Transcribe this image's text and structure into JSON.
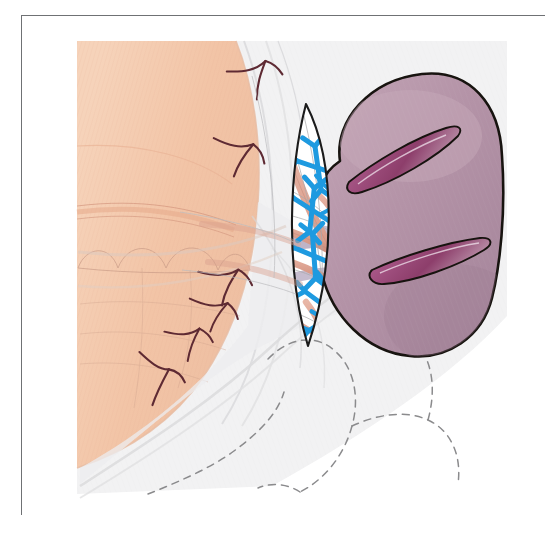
{
  "figure": {
    "caption": "",
    "frame": {
      "border_color": "#6f7174",
      "background": "#ffffff"
    }
  },
  "palette": {
    "skin_tissue": "#f3c7ab",
    "skin_tissue_light": "#f7d7c2",
    "kidney_body": "#b191a5",
    "kidney_body_light": "#c0a2b3",
    "kidney_outline": "#17130f",
    "incision_dark": "#8e4a72",
    "incision_deep": "#7a3a60",
    "vessel_pink": "#dda392",
    "vessel_pink_dark": "#c9897a",
    "nerve_blue": "#1e9ae0",
    "nerve_dark_red": "#5e2a33",
    "fascia_gray": "#e9e9ea",
    "fascia_gray_mid": "#dcdcdd",
    "dashed_outline": "#8b8b8d",
    "lens_fill": "#ffffff",
    "lens_outline": "#1b1b1b",
    "background_tint": "#f4f4f4"
  },
  "structures": [
    {
      "id": "abdominal-wall",
      "label": "Abdominal wall / peritoneal flap",
      "color": "#f3c7ab"
    },
    {
      "id": "kidney",
      "label": "Kidney",
      "color": "#b191a5"
    },
    {
      "id": "kidney-incision-upper",
      "label": "Upper renal capsule incision",
      "color": "#8e4a72"
    },
    {
      "id": "kidney-incision-lower",
      "label": "Lower renal capsule incision",
      "color": "#8e4a72"
    },
    {
      "id": "hilum-window",
      "label": "Renal hilum dissection window",
      "color": "#ffffff"
    },
    {
      "id": "renal-artery",
      "label": "Renal artery branches",
      "color": "#dda392"
    },
    {
      "id": "renal-vein",
      "label": "Renal vein",
      "color": "#c2a8bd"
    },
    {
      "id": "renal-nerve-plexus",
      "label": "Periarterial renal nerve plexus",
      "color": "#1e9ae0"
    },
    {
      "id": "peritoneal-nerves",
      "label": "Branching nerve / vessel twigs",
      "color": "#5e2a33"
    },
    {
      "id": "bowel-outline",
      "label": "Bowel outline (dashed)",
      "color": "#8b8b8d"
    },
    {
      "id": "gerota-fascia",
      "label": "Gerota fascia planes",
      "color": "#e9e9ea"
    }
  ],
  "nerve_nodes": [
    {
      "cx": 318,
      "cy": 155,
      "scale": 1.0,
      "rot": -8
    },
    {
      "cx": 296,
      "cy": 196,
      "scale": 1.0,
      "rot": 6
    },
    {
      "cx": 300,
      "cy": 236,
      "scale": 1.0,
      "rot": -4
    },
    {
      "cx": 312,
      "cy": 278,
      "scale": 0.95,
      "rot": 10
    },
    {
      "cx": 322,
      "cy": 186,
      "scale": 0.85,
      "rot": 14
    },
    {
      "cx": 318,
      "cy": 300,
      "scale": 0.8,
      "rot": -14
    }
  ],
  "peritoneal_nerve_twigs": [
    {
      "x": 232,
      "y": 55,
      "rot": -18,
      "scale": 1.0
    },
    {
      "x": 219,
      "y": 131,
      "rot": 8,
      "scale": 1.0
    },
    {
      "x": 203,
      "y": 261,
      "rot": -6,
      "scale": 1.0
    },
    {
      "x": 192,
      "y": 290,
      "rot": 4,
      "scale": 0.95
    },
    {
      "x": 166,
      "y": 320,
      "rot": -8,
      "scale": 0.95
    },
    {
      "x": 139,
      "y": 352,
      "rot": 10,
      "scale": 1.0
    }
  ]
}
